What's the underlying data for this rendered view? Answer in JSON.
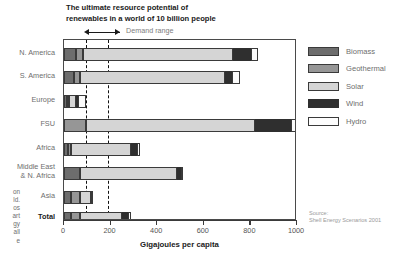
{
  "title": {
    "line1": "The ultimate resource potential of",
    "line2": "renewables in a world of 10 billion people"
  },
  "annotation": {
    "demand_range": "Demand range"
  },
  "source": {
    "line1": "Source:",
    "line2": "Shell Energy Scenarios 2001"
  },
  "bleed_text": [
    "on",
    "ld.",
    "os",
    "art",
    "gy",
    "all",
    "e"
  ],
  "legend": {
    "items": [
      {
        "label": "Biomass",
        "key": "biomass",
        "color": "#6d6d6d"
      },
      {
        "label": "Geothermal",
        "key": "geothermal",
        "color": "#969696"
      },
      {
        "label": "Solar",
        "key": "solar",
        "color": "#d5d5d5"
      },
      {
        "label": "Wind",
        "key": "wind",
        "color": "#2f2f2f"
      },
      {
        "label": "Hydro",
        "key": "hydro",
        "color": "#fbfbfb"
      }
    ]
  },
  "chart_data": {
    "type": "bar",
    "orientation": "horizontal",
    "stacked": true,
    "title": "The ultimate resource potential of renewables in a world of 10 billion people",
    "xlabel": "Gigajoules per capita",
    "ylabel": "",
    "xlim": [
      0,
      1000
    ],
    "xticks": [
      0,
      200,
      400,
      600,
      800,
      1000
    ],
    "grid": false,
    "legend_position": "right",
    "annotations": [
      {
        "text": "Demand range",
        "type": "range",
        "from": 95,
        "to": 190
      }
    ],
    "reference_lines": [
      95,
      190
    ],
    "series": [
      {
        "name": "Biomass",
        "values": [
          50,
          42,
          12,
          0,
          18,
          70,
          30,
          30
        ]
      },
      {
        "name": "Geothermal",
        "values": [
          30,
          27,
          10,
          95,
          14,
          0,
          38,
          40
        ]
      },
      {
        "name": "Solar",
        "values": [
          646,
          624,
          30,
          725,
          254,
          415,
          48,
          178
        ]
      },
      {
        "name": "Wind",
        "values": [
          78,
          28,
          8,
          155,
          26,
          18,
          0,
          25
        ]
      },
      {
        "name": "Hydro",
        "values": [
          28,
          35,
          34,
          38,
          14,
          5,
          5,
          14
        ]
      }
    ],
    "categories": [
      "N. America",
      "S. America",
      "Europe",
      "FSU",
      "Africa",
      "Middle East\n& N. Africa",
      "Asia",
      "Total"
    ],
    "category_labels": [
      {
        "lines": [
          "N. America"
        ],
        "bold": false
      },
      {
        "lines": [
          "S. America"
        ],
        "bold": false
      },
      {
        "lines": [
          "Europe"
        ],
        "bold": false
      },
      {
        "lines": [
          "FSU"
        ],
        "bold": false
      },
      {
        "lines": [
          "Africa"
        ],
        "bold": false
      },
      {
        "lines": [
          "Middle East",
          "& N. Africa"
        ],
        "bold": false
      },
      {
        "lines": [
          "Asia"
        ],
        "bold": false
      },
      {
        "lines": [
          "Total"
        ],
        "bold": true
      }
    ],
    "totals": [
      832,
      756,
      94,
      1013,
      326,
      508,
      121,
      287
    ]
  }
}
